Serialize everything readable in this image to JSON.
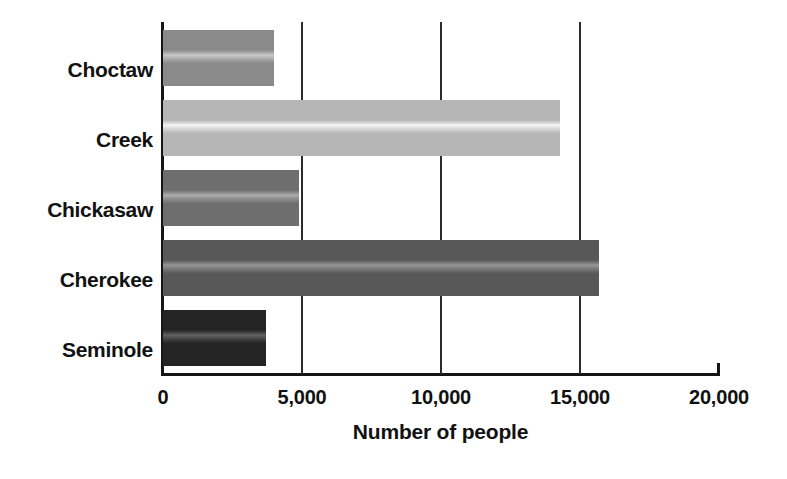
{
  "chart_data": {
    "type": "bar",
    "orientation": "horizontal",
    "title": "",
    "categories": [
      "Choctaw",
      "Creek",
      "Chickasaw",
      "Cherokee",
      "Seminole"
    ],
    "values": [
      4000,
      14300,
      4900,
      15700,
      3700
    ],
    "xlabel": "Number of people",
    "ylabel": "",
    "xlim": [
      0,
      20000
    ],
    "xticks": [
      0,
      5000,
      10000,
      15000,
      20000
    ],
    "xtick_labels": [
      "0",
      "5,000",
      "10,000",
      "15,000",
      "20,000"
    ],
    "grid": "vertical-only",
    "legend": "none",
    "bar_colors": [
      "#8a8a8a",
      "#b6b6b6",
      "#6e6e6e",
      "#585858",
      "#242424"
    ],
    "series": [
      {
        "name": "Number of people",
        "points": [
          {
            "category": "Choctaw",
            "value": 4000,
            "color": "#8a8a8a"
          },
          {
            "category": "Creek",
            "value": 14300,
            "color": "#b6b6b6"
          },
          {
            "category": "Chickasaw",
            "value": 4900,
            "color": "#6e6e6e"
          },
          {
            "category": "Cherokee",
            "value": 15700,
            "color": "#585858"
          },
          {
            "category": "Seminole",
            "value": 3700,
            "color": "#242424"
          }
        ]
      }
    ]
  },
  "axis": {
    "x_title": "Number of people",
    "tick_0": "0",
    "tick_1": "5,000",
    "tick_2": "10,000",
    "tick_3": "15,000",
    "tick_4": "20,000"
  },
  "categories": {
    "c0": "Choctaw",
    "c1": "Creek",
    "c2": "Chickasaw",
    "c3": "Cherokee",
    "c4": "Seminole"
  }
}
